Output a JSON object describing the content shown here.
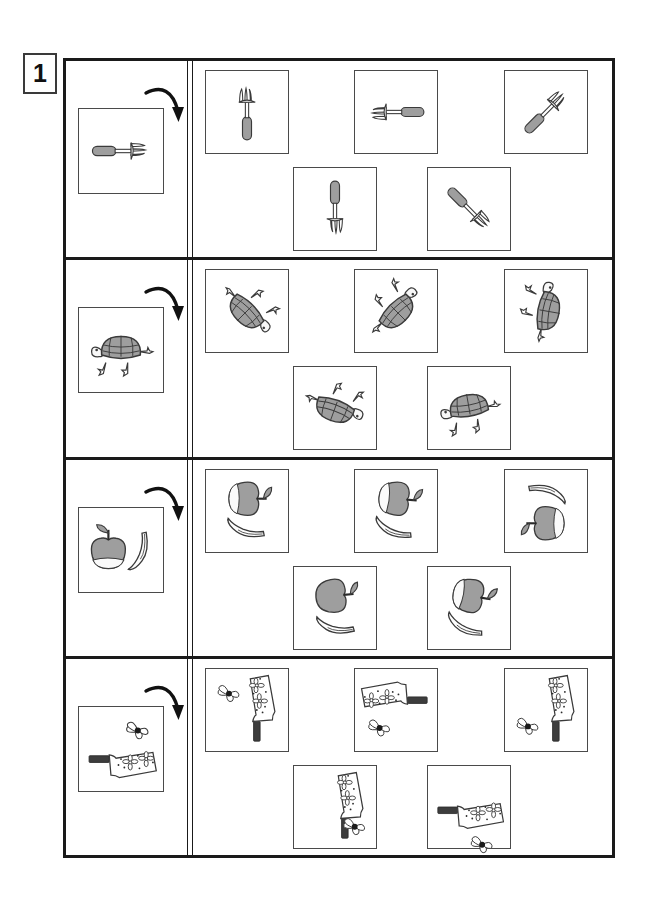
{
  "page": {
    "number": "1",
    "type": "mental-rotation-worksheet",
    "width": 649,
    "height": 906
  },
  "colors": {
    "ink": "#1a1a1a",
    "box_border": "#4a4a4a",
    "fill_gray": "#9e9e9e",
    "fill_light": "#f2f2f2",
    "handle_dark": "#3d3d3d",
    "paper": "#ffffff"
  },
  "instructions": {
    "arrow_icon": "curved-rotation-arrow",
    "arrow_meaning": "rotate clockwise"
  },
  "rows": [
    {
      "id": "row-fork",
      "prompt": {
        "object": "fork",
        "label": "fork pointing right",
        "rotation": 0
      },
      "options": [
        {
          "position": 1,
          "label": "fork pointing up",
          "rotation": 270
        },
        {
          "position": 2,
          "label": "fork pointing left",
          "rotation": 180
        },
        {
          "position": 3,
          "label": "fork tilted up-right",
          "rotation": 315
        },
        {
          "position": 4,
          "label": "fork pointing down",
          "rotation": 90
        },
        {
          "position": 5,
          "label": "fork tilted down-right",
          "rotation": 45
        }
      ]
    },
    {
      "id": "row-turtle",
      "prompt": {
        "object": "turtle",
        "label": "turtle facing left",
        "rotation": 0
      },
      "options": [
        {
          "position": 1,
          "label": "turtle rotated 225 degrees",
          "rotation": 225
        },
        {
          "position": 2,
          "label": "turtle rotated 135 degrees",
          "rotation": 135
        },
        {
          "position": 3,
          "label": "turtle rotated 100 degrees",
          "rotation": 100
        },
        {
          "position": 4,
          "label": "turtle rotated 200 degrees",
          "rotation": 200
        },
        {
          "position": 5,
          "label": "turtle rotated 350 degrees",
          "rotation": 350
        }
      ]
    },
    {
      "id": "row-apple-banana",
      "prompt": {
        "object": "apple-and-banana",
        "label": "apple left of banana",
        "rotation": 0
      },
      "options": [
        {
          "position": 1,
          "label": "apple above banana, rotated 90 degrees",
          "rotation": 90
        },
        {
          "position": 2,
          "label": "apple above banana, rotated 95 degrees",
          "rotation": 95
        },
        {
          "position": 3,
          "label": "banana above apple, rotated 270 degrees",
          "rotation": 270
        },
        {
          "position": 4,
          "label": "apple above banana, rotated 85 degrees",
          "rotation": 85
        },
        {
          "position": 5,
          "label": "apple above banana, rotated 100 degrees",
          "rotation": 100
        }
      ]
    },
    {
      "id": "row-brush-bee",
      "prompt": {
        "object": "flower-brush-and-bee",
        "label": "bee above brush, brush handle left",
        "rotation": 0
      },
      "options": [
        {
          "position": 1,
          "label": "brush vertical handle up, bee left",
          "rotation": 90
        },
        {
          "position": 2,
          "label": "brush horizontal handle right, bee below left",
          "rotation": 180
        },
        {
          "position": 3,
          "label": "brush vertical handle up, bee right",
          "rotation": 90
        },
        {
          "position": 4,
          "label": "brush vertical handle up, bee lower right",
          "rotation": 90
        },
        {
          "position": 5,
          "label": "brush horizontal handle left, bee below",
          "rotation": 0
        }
      ]
    }
  ]
}
